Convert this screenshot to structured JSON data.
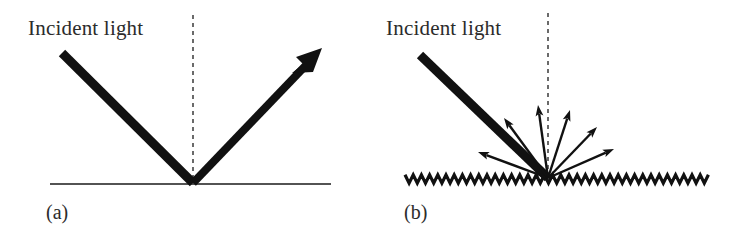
{
  "figure": {
    "background_color": "#ffffff",
    "ink_color": "#1a1a1a",
    "text_color": "#2b2b2b",
    "width": 751,
    "height": 231
  },
  "panels": [
    {
      "id": "a",
      "caption": "(a)",
      "caption_pos": {
        "x": 46,
        "y": 219
      },
      "incident_label": "Incident light",
      "incident_label_pos": {
        "x": 28,
        "y": 35
      },
      "surface": {
        "type": "smooth-line",
        "x1": 50,
        "y1": 184,
        "x2": 331,
        "y2": 184,
        "stroke_width": 1.6
      },
      "normal": {
        "x1": 193,
        "y1": 15,
        "x2": 193,
        "y2": 182,
        "stroke_width": 1.5,
        "dash": "4 4"
      },
      "vertex": {
        "x": 193,
        "y": 183
      },
      "incident_ray": {
        "x1": 62,
        "y1": 53,
        "x2": 193,
        "y2": 183,
        "stroke_width": 9
      },
      "reflected_ray": {
        "x1": 193,
        "y1": 183,
        "x2": 313,
        "y2": 58,
        "stroke_width": 8,
        "arrowhead": {
          "tip_x": 321,
          "tip_y": 49,
          "size": 22
        }
      }
    },
    {
      "id": "b",
      "caption": "(b)",
      "caption_pos": {
        "x": 404,
        "y": 219
      },
      "incident_label": "Incident light",
      "incident_label_pos": {
        "x": 386,
        "y": 35
      },
      "surface": {
        "type": "zigzag-rough",
        "x_start": 405,
        "x_end": 712,
        "y_base": 179,
        "wavelength": 8.2,
        "amplitude": 4.2,
        "stroke_width": 3.2
      },
      "normal": {
        "x1": 548,
        "y1": 13,
        "x2": 548,
        "y2": 176,
        "stroke_width": 1.5,
        "dash": "4 4"
      },
      "vertex": {
        "x": 548,
        "y": 178
      },
      "incident_ray": {
        "x1": 420,
        "y1": 55,
        "x2": 548,
        "y2": 178,
        "stroke_width": 9
      },
      "scattered_rays": [
        {
          "name": "scatter-ray-far-left",
          "tip_x": 478,
          "tip_y": 152,
          "stroke_width": 2.4,
          "head_size": 11
        },
        {
          "name": "scatter-ray-left",
          "tip_x": 504,
          "tip_y": 118,
          "stroke_width": 2.4,
          "head_size": 11
        },
        {
          "name": "scatter-ray-center-left",
          "tip_x": 538,
          "tip_y": 105,
          "stroke_width": 2.4,
          "head_size": 11
        },
        {
          "name": "scatter-ray-center-right",
          "tip_x": 570,
          "tip_y": 110,
          "stroke_width": 2.4,
          "head_size": 11
        },
        {
          "name": "scatter-ray-right",
          "tip_x": 597,
          "tip_y": 127,
          "stroke_width": 2.4,
          "head_size": 11
        },
        {
          "name": "scatter-ray-far-right",
          "tip_x": 614,
          "tip_y": 149,
          "stroke_width": 2.4,
          "head_size": 11
        }
      ]
    }
  ]
}
